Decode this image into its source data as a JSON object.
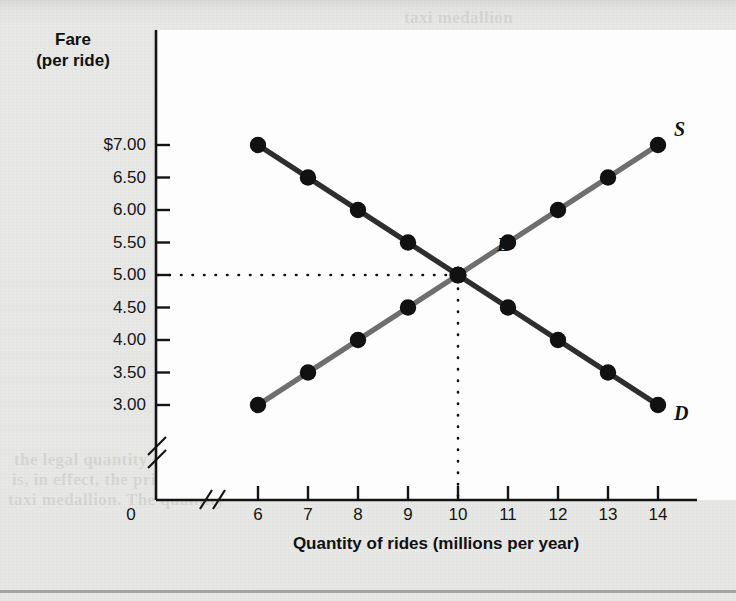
{
  "figure": {
    "background_color": "#e7e7e5",
    "plot_background_color": "#fdfdfd"
  },
  "chart_data": {
    "type": "line",
    "title": "",
    "xlabel": "Quantity of rides (millions per year)",
    "ylabel": "Fare (per ride)",
    "ylabel_line1": "Fare",
    "ylabel_line2": "(per ride)",
    "x": [
      6,
      7,
      8,
      9,
      10,
      11,
      12,
      13,
      14
    ],
    "xtick_labels": [
      "6",
      "7",
      "8",
      "9",
      "10",
      "11",
      "12",
      "13",
      "14"
    ],
    "origin_label": "0",
    "ytick_labels": [
      "$7.00",
      "6.50",
      "6.00",
      "5.50",
      "5.00",
      "4.50",
      "4.00",
      "3.50",
      "3.00"
    ],
    "ytick_values": [
      7.0,
      6.5,
      6.0,
      5.5,
      5.0,
      4.5,
      4.0,
      3.5,
      3.0
    ],
    "ylim": [
      3.0,
      7.0
    ],
    "xlim": [
      6,
      14
    ],
    "axis_break_x": true,
    "axis_break_y": true,
    "grid": false,
    "legend": "inline-curve-labels",
    "series": [
      {
        "name": "Demand",
        "label": "D",
        "color": "#2e2e2e",
        "values": [
          7.0,
          6.5,
          6.0,
          5.5,
          5.0,
          4.5,
          4.0,
          3.5,
          3.0
        ]
      },
      {
        "name": "Supply",
        "label": "S",
        "color": "#6e6e6e",
        "values": [
          3.0,
          3.5,
          4.0,
          4.5,
          5.0,
          5.5,
          6.0,
          6.5,
          7.0
        ]
      }
    ],
    "annotations": [
      {
        "label": "E",
        "name": "equilibrium",
        "x": 10,
        "y": 5.0,
        "guide_lines": "dotted"
      }
    ]
  },
  "ghost_text": [
    {
      "text": "taxi medallion",
      "x": 404,
      "y": 8
    },
    {
      "text": "york City taxi and limousine",
      "x": 372,
      "y": 30
    },
    {
      "text": "a taxi in the city, you have to",
      "x": 396,
      "y": 54
    },
    {
      "text": "quantity, and the number",
      "x": 388,
      "y": 104
    },
    {
      "text": "rest quantity is 10 million",
      "x": 374,
      "y": 126
    },
    {
      "text": "In fact, the price ceiling",
      "x": 368,
      "y": 148
    },
    {
      "text": "and other arrangements",
      "x": 382,
      "y": 170
    },
    {
      "text": "tion. Of course, though",
      "x": 386,
      "y": 192
    },
    {
      "text": "can increase",
      "x": 392,
      "y": 214
    },
    {
      "text": "to limit the number of rides",
      "x": 378,
      "y": 236
    },
    {
      "text": "taxi medallion, they cannot",
      "x": 374,
      "y": 258
    },
    {
      "text": "the medallions. So, for each",
      "x": 376,
      "y": 280
    },
    {
      "text": "A quantity control, or quota",
      "x": 394,
      "y": 432
    },
    {
      "text": "the legal quantity set by the",
      "x": 14,
      "y": 450
    },
    {
      "text": "is, in effect, the price of the",
      "x": 12,
      "y": 470
    },
    {
      "text": "taxi medallion. The quantity",
      "x": 8,
      "y": 490
    }
  ]
}
